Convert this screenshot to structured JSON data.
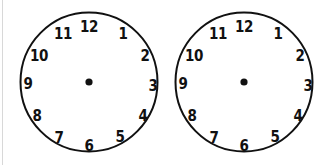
{
  "page": {
    "background_color": "#ffffff",
    "width": 327,
    "height": 165,
    "stroke_color": "#111111",
    "edge_rule_color": "#d8d8d8"
  },
  "worksheet": {
    "title": "",
    "clock_count": 2,
    "clocks": [
      {
        "id": "clock-1",
        "has_hands": false,
        "hour_hand": "",
        "minute_hand": "",
        "center_dot": true,
        "numerals": [
          "1",
          "2",
          "3",
          "4",
          "5",
          "6",
          "7",
          "8",
          "9",
          "10",
          "11",
          "12"
        ]
      },
      {
        "id": "clock-2",
        "has_hands": false,
        "hour_hand": "",
        "minute_hand": "",
        "center_dot": true,
        "numerals": [
          "1",
          "2",
          "3",
          "4",
          "5",
          "6",
          "7",
          "8",
          "9",
          "10",
          "11",
          "12"
        ]
      }
    ],
    "numeral_positions": [
      {
        "label": "12",
        "x": 70,
        "y": 16
      },
      {
        "label": "1",
        "x": 104,
        "y": 23
      },
      {
        "label": "2",
        "x": 126,
        "y": 45
      },
      {
        "label": "3",
        "x": 134,
        "y": 75
      },
      {
        "label": "4",
        "x": 124,
        "y": 105
      },
      {
        "label": "5",
        "x": 101,
        "y": 126
      },
      {
        "label": "6",
        "x": 70,
        "y": 135
      },
      {
        "label": "7",
        "x": 40,
        "y": 127
      },
      {
        "label": "8",
        "x": 18,
        "y": 105
      },
      {
        "label": "9",
        "x": 9,
        "y": 73
      },
      {
        "label": "10",
        "x": 20,
        "y": 45
      },
      {
        "label": "11",
        "x": 44,
        "y": 23
      }
    ]
  }
}
